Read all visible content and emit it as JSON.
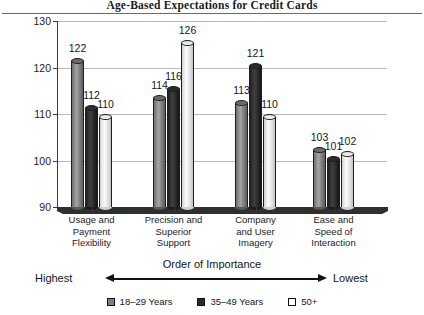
{
  "chart_data": {
    "type": "bar",
    "title": "Age-Based Expectations for Credit Cards",
    "xlabel": "Order of Importance",
    "ylabel": "",
    "ylim": [
      90,
      130
    ],
    "yticks": [
      130,
      120,
      110,
      100,
      90
    ],
    "grid": true,
    "legend_position": "bottom",
    "categories": [
      "Usage and Payment Flexibility",
      "Precision and Superior Support",
      "Company and User Imagery",
      "Ease and Speed of Interaction"
    ],
    "category_lines": [
      [
        "Usage and",
        "Payment",
        "Flexibility"
      ],
      [
        "Precision and",
        "Superior",
        "Support"
      ],
      [
        "Company",
        "and User",
        "Imagery"
      ],
      [
        "Ease and",
        "Speed of",
        "Interaction"
      ]
    ],
    "series": [
      {
        "name": "18–29 Years",
        "color": "#7d7d7d",
        "values": [
          122,
          114,
          113,
          103
        ]
      },
      {
        "name": "35–49 Years",
        "color": "#2a2a2a",
        "values": [
          112,
          116,
          121,
          101
        ]
      },
      {
        "name": "50+",
        "color": "#ffffff",
        "values": [
          110,
          126,
          110,
          102
        ]
      }
    ],
    "annotations": {
      "axis_note": "Order of Importance",
      "left_end": "Highest",
      "right_end": "Lowest"
    }
  },
  "icons": {
    "arrow_left": "left-arrow-icon",
    "arrow_right": "right-arrow-icon"
  }
}
